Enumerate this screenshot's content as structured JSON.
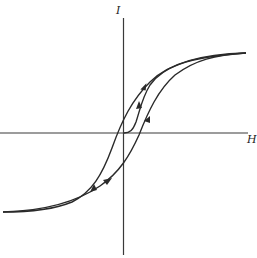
{
  "diagram": {
    "type": "hysteresis-loop",
    "axes": {
      "vertical_label": "I",
      "horizontal_label": "H"
    },
    "colors": {
      "stroke": "#2a2a2a",
      "background": "#ffffff"
    },
    "curves": [
      {
        "name": "initial-magnetization-curve",
        "direction": "up-right"
      },
      {
        "name": "descending-branch",
        "direction": "down-left"
      },
      {
        "name": "ascending-branch",
        "direction": "up-right"
      }
    ]
  }
}
